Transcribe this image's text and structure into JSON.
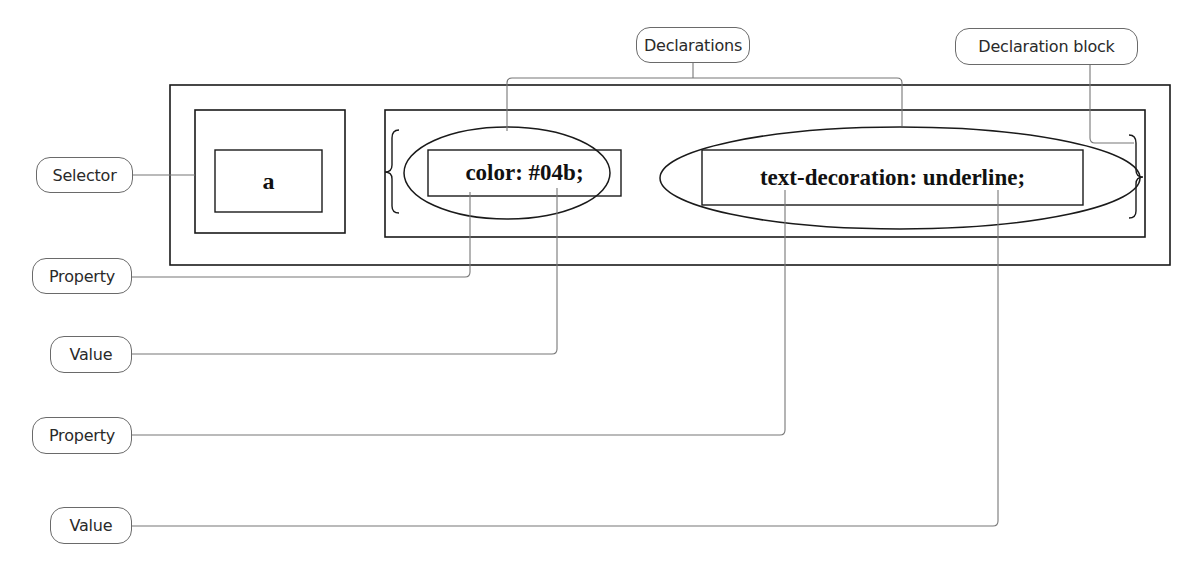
{
  "diagram": {
    "rule": {
      "selector": "a",
      "declarations": [
        {
          "text": "color: #04b;",
          "property": "color",
          "value": "#04b"
        },
        {
          "text": "text-decoration: underline;",
          "property": "text-decoration",
          "value": "underline"
        }
      ]
    },
    "labels": {
      "declarations": "Declarations",
      "declaration_block": "Declaration block",
      "selector": "Selector",
      "property_1": "Property",
      "value_1": "Value",
      "property_2": "Property",
      "value_2": "Value"
    },
    "colors": {
      "stroke": "#1a1a1a",
      "leader_line": "#777777",
      "background": "#ffffff"
    }
  }
}
